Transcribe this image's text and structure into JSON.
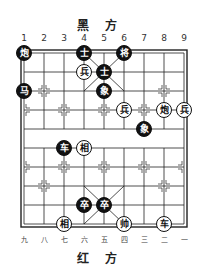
{
  "header": {
    "title": "黑 方"
  },
  "footer": {
    "title": "红 方"
  },
  "columns_top": [
    "1",
    "2",
    "3",
    "4",
    "5",
    "6",
    "7",
    "8",
    "9"
  ],
  "columns_bottom": [
    "九",
    "八",
    "七",
    "六",
    "五",
    "四",
    "三",
    "二",
    "一"
  ],
  "board": {
    "cols": 9,
    "rows": 10,
    "origin_x": 24,
    "origin_y": 53,
    "step_x": 20,
    "step_y": 19
  },
  "pieces": [
    {
      "side": "black",
      "label": "炮",
      "col": 1,
      "row": 0
    },
    {
      "side": "black",
      "label": "士",
      "col": 4,
      "row": 0
    },
    {
      "side": "black",
      "label": "将",
      "col": 6,
      "row": 0
    },
    {
      "side": "red",
      "label": "兵",
      "col": 4,
      "row": 1
    },
    {
      "side": "black",
      "label": "士",
      "col": 5,
      "row": 1
    },
    {
      "side": "black",
      "label": "马",
      "col": 1,
      "row": 2
    },
    {
      "side": "black",
      "label": "象",
      "col": 5,
      "row": 2
    },
    {
      "side": "red",
      "label": "兵",
      "col": 6,
      "row": 3
    },
    {
      "side": "red",
      "label": "炮",
      "col": 8,
      "row": 3
    },
    {
      "side": "red",
      "label": "兵",
      "col": 9,
      "row": 3
    },
    {
      "side": "black",
      "label": "象",
      "col": 7,
      "row": 4
    },
    {
      "side": "black",
      "label": "车",
      "col": 3,
      "row": 5
    },
    {
      "side": "red",
      "label": "相",
      "col": 4,
      "row": 5
    },
    {
      "side": "black",
      "label": "卒",
      "col": 4,
      "row": 8
    },
    {
      "side": "black",
      "label": "卒",
      "col": 5,
      "row": 8
    },
    {
      "side": "red",
      "label": "相",
      "col": 3,
      "row": 9
    },
    {
      "side": "red",
      "label": "帅",
      "col": 6,
      "row": 9
    },
    {
      "side": "red",
      "label": "车",
      "col": 8,
      "row": 9
    }
  ]
}
